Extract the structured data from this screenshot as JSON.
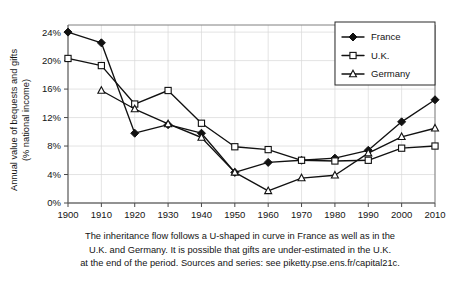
{
  "chart_data": {
    "type": "line",
    "title": "",
    "xlabel": "",
    "ylabel": "Annual value of bequests and gifts (% national income)",
    "ylabel_line1": "Annual value of bequests and gifts",
    "ylabel_line2": "(% national income)",
    "categories": [
      1900,
      1910,
      1920,
      1930,
      1940,
      1950,
      1960,
      1970,
      1980,
      1990,
      2000,
      2010
    ],
    "x": [
      1900,
      1910,
      1920,
      1930,
      1940,
      1950,
      1960,
      1970,
      1980,
      1990,
      2000,
      2010
    ],
    "xlim": [
      1900,
      2010
    ],
    "ylim": [
      0,
      25
    ],
    "yticks": [
      0,
      4,
      8,
      12,
      16,
      20,
      24
    ],
    "ytick_labels": [
      "0%",
      "4%",
      "8%",
      "12%",
      "16%",
      "20%",
      "24%"
    ],
    "xtick_labels": [
      "1900",
      "1910",
      "1920",
      "1930",
      "1940",
      "1950",
      "1960",
      "1970",
      "1980",
      "1990",
      "2000",
      "2010"
    ],
    "grid": true,
    "legend_position": "top-right",
    "series": [
      {
        "name": "France",
        "marker": "filled-diamond",
        "color": "#111111",
        "values": [
          24.0,
          22.5,
          9.8,
          11.0,
          9.8,
          4.3,
          5.7,
          6.0,
          6.3,
          7.4,
          11.4,
          14.5
        ]
      },
      {
        "name": "U.K.",
        "marker": "open-square",
        "color": "#111111",
        "values": [
          20.3,
          19.3,
          13.9,
          15.8,
          11.2,
          7.9,
          7.5,
          6.0,
          5.9,
          6.0,
          7.7,
          8.0
        ]
      },
      {
        "name": "Germany",
        "marker": "open-triangle",
        "color": "#111111",
        "values": [
          null,
          15.8,
          13.2,
          11.1,
          9.2,
          4.3,
          1.7,
          3.5,
          3.9,
          7.0,
          9.3,
          10.5
        ]
      }
    ],
    "caption_lines": [
      "The inheritance flow follows a U-shaped in curve in France as well as in the",
      "U.K. and Germany. It is possible that gifts are under-estimated in the U.K.",
      "at the end of the period. Sources and series: see piketty.pse.ens.fr/capital21c."
    ]
  },
  "legend": {
    "items": [
      {
        "label": "France"
      },
      {
        "label": "U.K."
      },
      {
        "label": "Germany"
      }
    ]
  }
}
